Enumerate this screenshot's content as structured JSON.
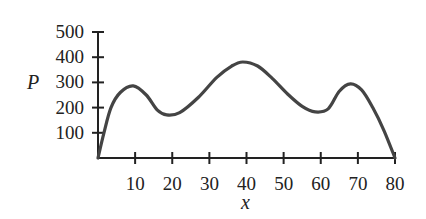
{
  "chart_data": {
    "type": "line",
    "title": "",
    "xlabel": "x",
    "ylabel": "P",
    "xlim": [
      0,
      80
    ],
    "ylim": [
      0,
      500
    ],
    "grid": false,
    "legend": null,
    "x_ticks": [
      10,
      20,
      30,
      40,
      50,
      60,
      70,
      80
    ],
    "x_tick_labels": [
      "10",
      "20",
      "30",
      "40",
      "50",
      "60",
      "70",
      "80"
    ],
    "y_ticks": [
      100,
      200,
      300,
      400,
      500
    ],
    "y_tick_labels": [
      "100",
      "200",
      "300",
      "400",
      "500"
    ],
    "series": [
      {
        "name": "P(x)",
        "color": "#444444",
        "x": [
          0,
          1.6,
          3.5,
          6,
          9.5,
          13,
          16,
          18.5,
          22,
          27,
          32,
          36,
          39,
          43,
          47,
          51,
          55,
          58.5,
          62,
          65,
          68,
          71,
          74,
          77,
          80
        ],
        "y": [
          0,
          100,
          200,
          260,
          286,
          250,
          190,
          171,
          180,
          240,
          320,
          365,
          381,
          365,
          315,
          255,
          205,
          183,
          195,
          265,
          294,
          270,
          200,
          110,
          0
        ]
      }
    ],
    "annotations": {
      "local_maxima": [
        {
          "x": 9.5,
          "y": 286
        },
        {
          "x": 39,
          "y": 381
        },
        {
          "x": 68,
          "y": 294
        }
      ],
      "local_minima": [
        {
          "x": 18.5,
          "y": 171
        },
        {
          "x": 58.5,
          "y": 183
        }
      ]
    }
  },
  "axis": {
    "x_title": "x",
    "y_title": "P",
    "color": "#222222"
  }
}
